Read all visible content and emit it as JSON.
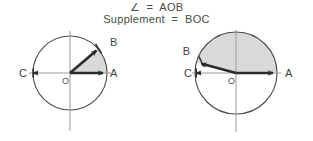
{
  "figure": {
    "caption": {
      "line1_symbol": "∠",
      "line1_equals": "=",
      "line1_value": "AOB",
      "line1_full": "∠  =  AOB",
      "line2_label": "Supplement",
      "line2_equals": "=",
      "line2_value": "BOC",
      "line2_full": "Supplement  =  BOC"
    },
    "colors": {
      "ink": "#3a3a3a",
      "shade": "#d9d9d9",
      "circle_stroke": "#4a4a4a",
      "axis_stroke": "#8a8a8a",
      "ray_stroke": "#2b2b2b"
    },
    "diagrams": [
      {
        "id": "acute-angle-diagram",
        "name": "acute angle AOB with shaded sector",
        "center_label": "O",
        "radius": 37,
        "points": [
          {
            "label": "A",
            "angle_deg": 0,
            "arrow": true
          },
          {
            "label": "B",
            "angle_deg": 40,
            "arrow": true
          },
          {
            "label": "C",
            "angle_deg": 180,
            "arrow": true
          }
        ],
        "shaded_sector": {
          "from_label": "A",
          "to_label": "B",
          "from_deg": 0,
          "to_deg": 40
        },
        "rays": [
          "OA",
          "OB"
        ],
        "angle_aob_deg": 40,
        "supplement_boc_deg": 140
      },
      {
        "id": "obtuse-angle-diagram",
        "name": "obtuse angle AOB with shaded sector",
        "center_label": "O",
        "radius": 41,
        "points": [
          {
            "label": "A",
            "angle_deg": 0,
            "arrow": true
          },
          {
            "label": "B",
            "angle_deg": 165,
            "arrow": true
          },
          {
            "label": "C",
            "angle_deg": 180,
            "arrow": true
          }
        ],
        "shaded_sector": {
          "from_label": "A",
          "to_label": "B",
          "from_deg": 0,
          "to_deg": 165
        },
        "rays": [
          "OA",
          "OB"
        ],
        "angle_aob_deg": 165,
        "supplement_boc_deg": 15
      }
    ]
  }
}
